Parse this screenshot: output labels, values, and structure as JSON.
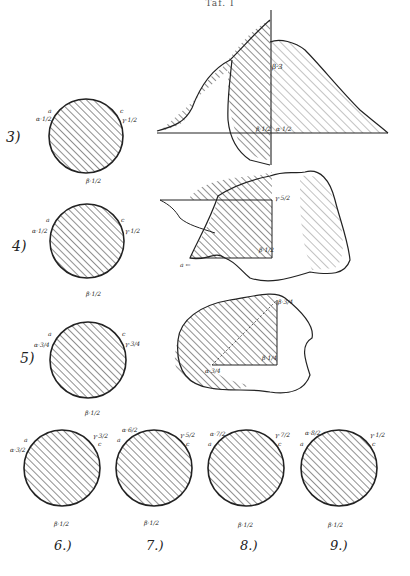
{
  "header": {
    "text": "Taf. I"
  },
  "figures": [
    {
      "num": "3)",
      "labels": {
        "a": "a",
        "alpha": "α·1/2",
        "c": "c",
        "gamma": "γ·1/2",
        "b": "b",
        "beta": "β·1/2"
      }
    },
    {
      "num": "4)",
      "labels": {
        "a": "a",
        "alpha": "α·1/2",
        "c": "c",
        "gamma": "γ·1/2",
        "b": "b",
        "beta": "β·1/2"
      }
    },
    {
      "num": "5)",
      "labels": {
        "a": "a",
        "alpha": "α·3/4",
        "c": "c",
        "gamma": "γ·3/4",
        "b": "b",
        "beta": "β·1/2"
      }
    },
    {
      "num": "6.)",
      "labels": {
        "a": "a",
        "alpha": "α·3/2",
        "c": "c",
        "gamma": "γ·3/2",
        "b": "b",
        "beta": "β·1/2"
      }
    },
    {
      "num": "7.)",
      "labels": {
        "a": "a",
        "alpha": "α·6/2",
        "c": "c",
        "gamma": "γ·5/2",
        "b": "b",
        "beta": "β·1/2"
      }
    },
    {
      "num": "8.)",
      "labels": {
        "a": "a",
        "alpha": "α·7/2",
        "c": "c",
        "gamma": "γ·7/2",
        "b": "b",
        "beta": "β·1/2"
      }
    },
    {
      "num": "9.)",
      "labels": {
        "a": "a",
        "alpha": "α·8/2",
        "c": "c",
        "gamma": "γ·1/2",
        "b": "b",
        "beta": "β·1/2"
      }
    }
  ],
  "shapes": [
    {
      "labels": {
        "top": "β·3",
        "left": "β·1/2",
        "right": "α·1/2"
      }
    },
    {
      "labels": {
        "top": "γ·5/2",
        "mid": "β·1/2",
        "arrow": "a ←"
      }
    },
    {
      "labels": {
        "top": "β·3/4",
        "mid": "β·1/4",
        "low": "α·3/4"
      }
    }
  ]
}
